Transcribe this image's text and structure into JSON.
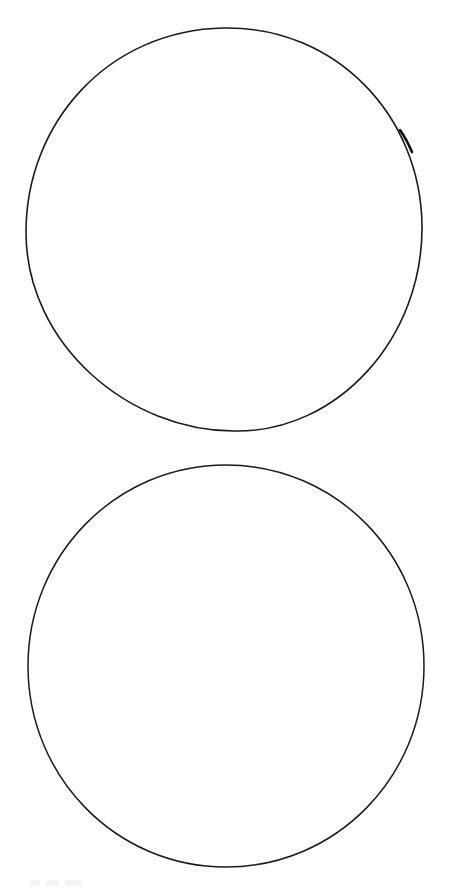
{
  "page": {
    "background_color": "#ffffff",
    "stroke_color": "#1a1a1a"
  },
  "shapes": [
    {
      "id": "top-circle",
      "kind": "circle-outline"
    },
    {
      "id": "bottom-circle",
      "kind": "circle-outline"
    }
  ],
  "watermark": {
    "legible": false
  }
}
